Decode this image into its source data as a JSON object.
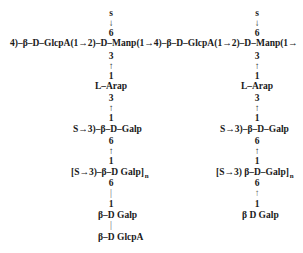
{
  "main_chain": "4)–β–D–GlcpA(1→2)–D–Manp(1→4)–β–D–GlcpA(1→2)–D–Manp(1→",
  "left_branch": {
    "top_s": "s",
    "top_arrow": "↓",
    "top_pos": "6",
    "rows": [
      {
        "text": "3"
      },
      {
        "text": "↑"
      },
      {
        "text": "1"
      },
      {
        "text": "L–Arap"
      },
      {
        "text": "3"
      },
      {
        "text": "↑"
      },
      {
        "text": "1"
      },
      {
        "text": "S→3)–β–D–Galp"
      },
      {
        "text": "6"
      },
      {
        "text": "↑"
      },
      {
        "text": "1"
      },
      {
        "text": "[S→3)–β–D Galp]",
        "subscript": "n"
      },
      {
        "text": "6"
      },
      {
        "text": "|"
      },
      {
        "text": "1"
      },
      {
        "text": "β–D Galp"
      },
      {
        "text": "|"
      },
      {
        "text": "β–D GlcpA"
      }
    ]
  },
  "right_branch": {
    "top_s": "s",
    "top_arrow": "↓",
    "top_pos": "6",
    "rows": [
      {
        "text": "3"
      },
      {
        "text": "↑"
      },
      {
        "text": "1"
      },
      {
        "text": "L–Arap"
      },
      {
        "text": "3"
      },
      {
        "text": "↑"
      },
      {
        "text": "1"
      },
      {
        "text": "S→3)–β–D–Galp"
      },
      {
        "text": "6"
      },
      {
        "text": "↑"
      },
      {
        "text": "1"
      },
      {
        "text": "[S→3) β–D–Galp]",
        "subscript": "n"
      },
      {
        "text": "6"
      },
      {
        "text": "↑"
      },
      {
        "text": "1"
      },
      {
        "text": "β D Galp"
      }
    ]
  }
}
